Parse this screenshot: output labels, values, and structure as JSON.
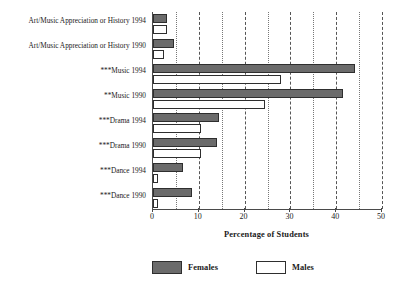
{
  "chart_data": {
    "type": "bar",
    "orientation": "horizontal",
    "title": "",
    "xlabel": "Percentage of Students",
    "ylabel": "",
    "xlim": [
      0,
      50
    ],
    "xticks": [
      0,
      10,
      20,
      30,
      40,
      50
    ],
    "xtick_labels": [
      "0",
      "10",
      "20",
      "30",
      "40",
      "50"
    ],
    "gridlines": [
      5,
      10,
      15,
      20,
      25,
      30,
      35,
      40,
      45,
      50
    ],
    "grid": true,
    "legend_position": "bottom",
    "categories": [
      "Art/Music Appreciation or History 1994",
      "Art/Music Appreciation or History 1990",
      "***Music 1994",
      "**Music 1990",
      "***Drama 1994",
      "***Drama 1990",
      "***Dance 1994",
      "***Dance 1990"
    ],
    "series": [
      {
        "name": "Females",
        "color": "#6b6b6b",
        "values": [
          3.0,
          4.5,
          44.0,
          41.5,
          14.5,
          14.0,
          6.5,
          8.5
        ]
      },
      {
        "name": "Males",
        "color": "#ffffff",
        "values": [
          3.0,
          2.5,
          28.0,
          24.5,
          10.5,
          10.5,
          1.0,
          1.0
        ]
      }
    ]
  },
  "legend": {
    "items": [
      {
        "label": "Females",
        "swatch": "female"
      },
      {
        "label": "Males",
        "swatch": "male"
      }
    ]
  }
}
